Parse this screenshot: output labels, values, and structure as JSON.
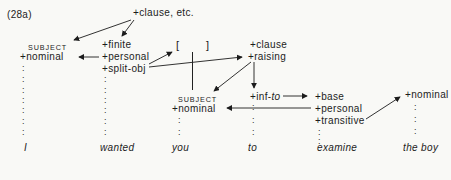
{
  "figure_label": "(28a)",
  "colors": {
    "ink": "#1c1c1c",
    "background": "#f9f9f6"
  },
  "nodes": {
    "clause_etc": "+clause, etc.",
    "subject_i": "SUBJECT",
    "nominal_i": "+nominal",
    "finite": "+finite",
    "personal_wanted": "+personal",
    "split_obj": "+split-obj",
    "bracket_left": "[",
    "bracket_right": "]",
    "clause": "+clause",
    "raising": "+raising",
    "subject_you": "SUBJECT",
    "nominal_you": "+nominal",
    "inf_to_prefix": "+inf-",
    "inf_to_italic": "to",
    "base": "+base",
    "personal_examine": "+personal",
    "transitive": "+transitive",
    "nominal_boy": "+nominal"
  },
  "sentence": {
    "words": [
      "I",
      "wanted",
      "you",
      "to",
      "examine",
      "the boy"
    ]
  },
  "dots_glyph": ":",
  "dots_columns": [
    {
      "column": "I",
      "x": 22,
      "ys": [
        67,
        78,
        89,
        99,
        109,
        120,
        131
      ]
    },
    {
      "column": "wanted",
      "x": 104,
      "ys": [
        78,
        89,
        99,
        109,
        120,
        131
      ]
    },
    {
      "column": "you",
      "x": 178,
      "ys": [
        119,
        131
      ]
    },
    {
      "column": "to",
      "x": 252,
      "ys": [
        106,
        119,
        131
      ]
    },
    {
      "column": "examine",
      "x": 318,
      "ys": [
        131,
        140
      ]
    },
    {
      "column": "the boy",
      "x": 414,
      "ys": [
        106,
        118,
        130
      ]
    }
  ],
  "dependencies": [
    {
      "from": "+clause, etc.",
      "to": "SUBJECT (I)"
    },
    {
      "from": "+clause, etc.",
      "to": "+finite (wanted)"
    },
    {
      "from": "+personal (wanted)",
      "to": "+nominal (I)"
    },
    {
      "from": "+split-obj (wanted)",
      "to": "[ ] empty object"
    },
    {
      "from": "+split-obj (wanted)",
      "to": "+raising (you-clause)"
    },
    {
      "from": "+raising",
      "to": "SUBJECT (you)"
    },
    {
      "from": "+raising",
      "to": "+inf-to (to)"
    },
    {
      "from": "+inf-to (to)",
      "to": "+base (examine)"
    },
    {
      "from": "+personal (examine)",
      "to": "+nominal (you)"
    },
    {
      "from": "+transitive (examine)",
      "to": "+nominal (the boy)"
    }
  ]
}
